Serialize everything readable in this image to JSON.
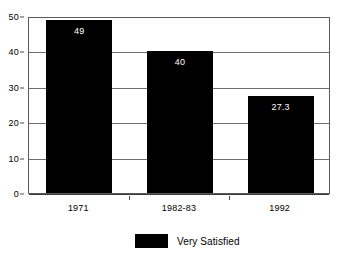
{
  "chart_data": {
    "type": "bar",
    "title": "",
    "subtitle": "",
    "xlabel": "",
    "ylabel": "",
    "categories": [
      "1971",
      "1982-83",
      "1992"
    ],
    "values": [
      49,
      40,
      27.3
    ],
    "value_labels": [
      "49",
      "40",
      "27.3"
    ],
    "series": [
      {
        "name": "Very Satisfied",
        "color": "#000000",
        "values": [
          49,
          40,
          27.3
        ]
      }
    ],
    "ylim": [
      0,
      50
    ],
    "yticks": [
      0,
      10,
      20,
      30,
      40,
      50
    ],
    "ytick_labels": [
      "0",
      "10",
      "20",
      "30",
      "40",
      "50"
    ],
    "grid": true,
    "grid_axis": "y",
    "legend": {
      "position": "bottom-center",
      "entries": [
        {
          "label": "Very Satisfied",
          "color": "#000000"
        }
      ]
    },
    "bar_value_label_color": "#ffffff",
    "plot_border_color": "#5a5a5a",
    "background_color": "#ffffff"
  }
}
